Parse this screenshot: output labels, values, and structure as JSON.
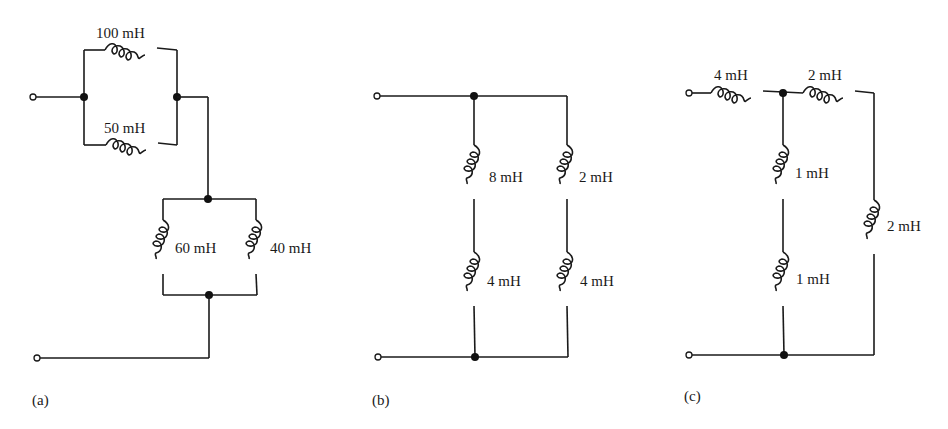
{
  "figure": {
    "panels": [
      {
        "id": "a",
        "label": "(a)",
        "inductors": [
          {
            "name": "L-top",
            "value": "100 mH"
          },
          {
            "name": "L-mid",
            "value": "50 mH"
          },
          {
            "name": "L-left",
            "value": "60 mH"
          },
          {
            "name": "L-right",
            "value": "40 mH"
          }
        ]
      },
      {
        "id": "b",
        "label": "(b)",
        "inductors": [
          {
            "name": "L-left-upper",
            "value": "8 mH"
          },
          {
            "name": "L-right-upper",
            "value": "2 mH"
          },
          {
            "name": "L-left-lower",
            "value": "4 mH"
          },
          {
            "name": "L-right-lower",
            "value": "4 mH"
          }
        ]
      },
      {
        "id": "c",
        "label": "(c)",
        "inductors": [
          {
            "name": "L-series-left",
            "value": "4 mH"
          },
          {
            "name": "L-series-right",
            "value": "2 mH"
          },
          {
            "name": "L-mid-upper",
            "value": "1 mH"
          },
          {
            "name": "L-mid-lower",
            "value": "1 mH"
          },
          {
            "name": "L-right",
            "value": "2 mH"
          }
        ]
      }
    ],
    "colors": {
      "ink": "#1a1a1a",
      "background": "#ffffff"
    }
  }
}
